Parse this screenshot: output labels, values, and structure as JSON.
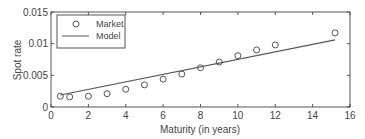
{
  "chart_data": {
    "type": "scatter",
    "title": "",
    "xlabel": "Maturity (in years)",
    "ylabel": "Spot rate",
    "xlim": [
      0,
      16
    ],
    "ylim": [
      0,
      0.015
    ],
    "xticks": [
      0,
      2,
      4,
      6,
      8,
      10,
      12,
      14,
      16
    ],
    "xtick_labels": [
      "0",
      "2",
      "4",
      "6",
      "8",
      "10",
      "12",
      "14",
      "16"
    ],
    "yticks": [
      0,
      0.005,
      0.01,
      0.015
    ],
    "ytick_labels": [
      "0",
      "0.005",
      "0.01",
      "0.015"
    ],
    "grid": false,
    "legend": {
      "position": "upper left",
      "entries": [
        "Market",
        "Model"
      ]
    },
    "series": [
      {
        "name": "Market",
        "style": "markers-circle",
        "x": [
          0.5,
          1,
          2,
          3,
          4,
          5,
          6,
          7,
          8,
          9,
          10,
          11,
          12,
          15.2
        ],
        "y": [
          0.0017,
          0.0016,
          0.0017,
          0.0021,
          0.0028,
          0.0035,
          0.0044,
          0.0052,
          0.0062,
          0.0071,
          0.0081,
          0.009,
          0.0098,
          0.0117
        ]
      },
      {
        "name": "Model",
        "style": "line",
        "x": [
          0.5,
          15.2
        ],
        "y": [
          0.0019,
          0.0106
        ]
      }
    ]
  },
  "colors": {
    "axis": "#555555",
    "marker": "#555555",
    "line": "#555555"
  }
}
